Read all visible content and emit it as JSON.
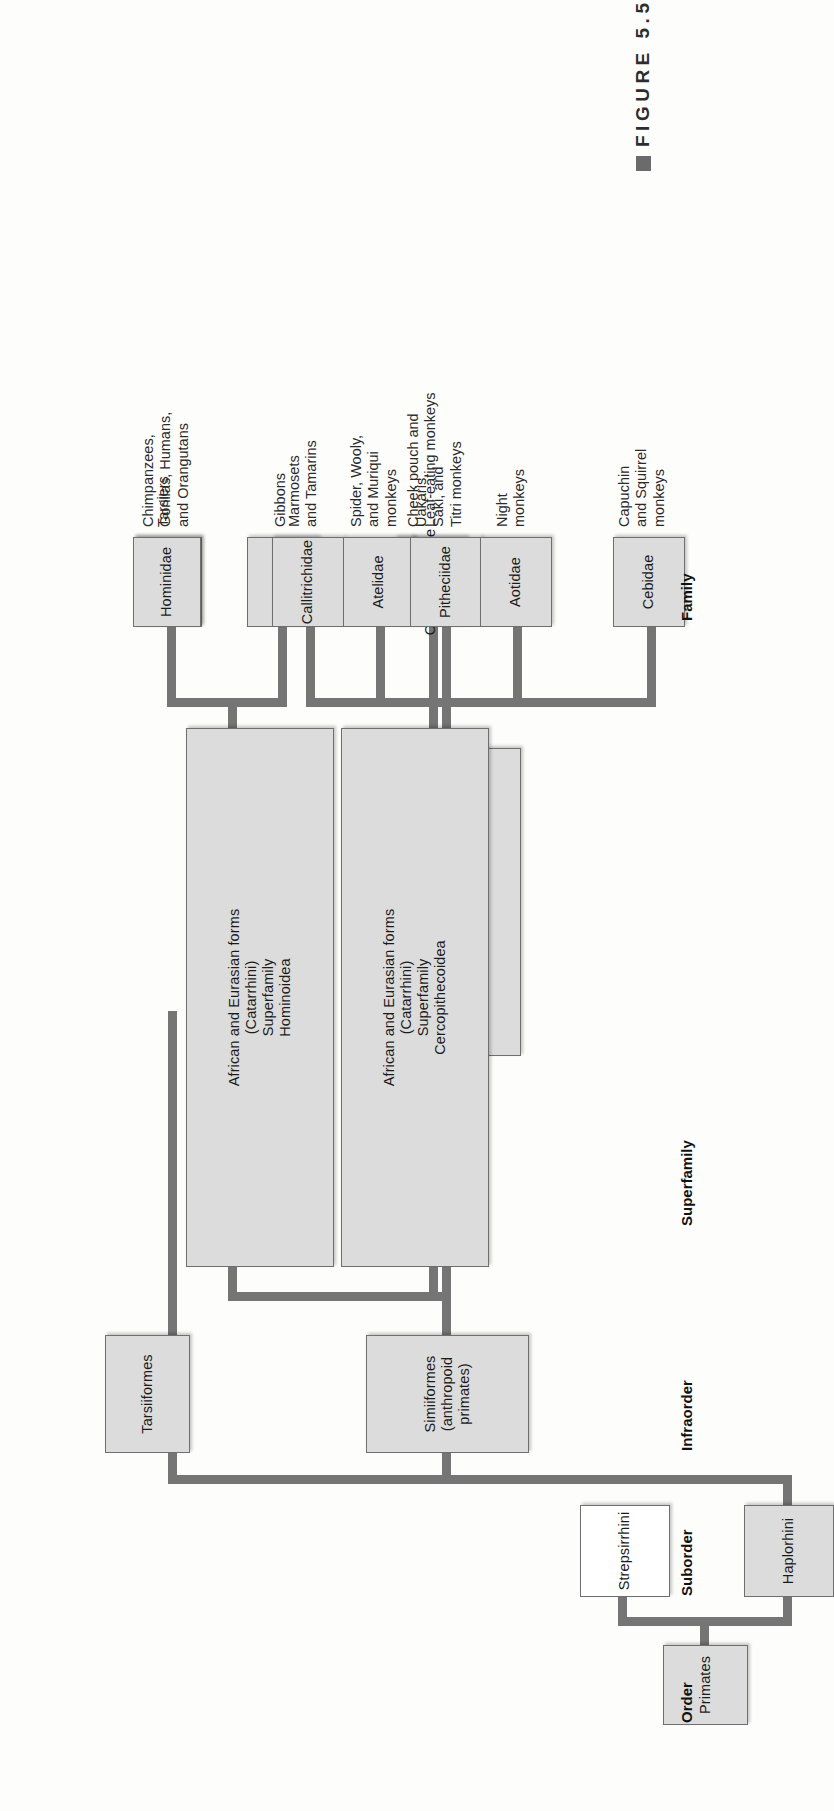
{
  "figure": {
    "caption_label": "FIGURE 5.5",
    "bullet_icon": "filled-square-bullet"
  },
  "rank_labels": [
    {
      "id": "order",
      "text": "Order"
    },
    {
      "id": "suborder",
      "text": "Suborder"
    },
    {
      "id": "infraorder",
      "text": "Infraorder"
    },
    {
      "id": "superfamily",
      "text": "Superfamily"
    },
    {
      "id": "family",
      "text": "Family"
    }
  ],
  "colors": {
    "box_fill": "#dcdcdc",
    "box_fill_hollow": "#ffffff",
    "box_border": "#6f6f6f",
    "connector": "#757575",
    "text": "#1b1b1b",
    "background": "#fdfdfc"
  },
  "nodes": {
    "primates": {
      "label": "Primates",
      "rank": "Order",
      "fill": "filled"
    },
    "strepsirrhini": {
      "label": "Strepsirrhini",
      "rank": "Suborder",
      "fill": "hollow"
    },
    "haplorhini": {
      "label": "Haplorhini",
      "rank": "Suborder",
      "fill": "filled"
    },
    "tarsiiformes": {
      "label": "Tarsiiformes",
      "rank": "Infraorder",
      "fill": "filled"
    },
    "simiiformes": {
      "label": "Simiiformes\n(anthropoid primates)",
      "rank": "Infraorder",
      "fill": "filled"
    },
    "ceboidea": {
      "label": "N. and S. American forms\n(Platyrrhini)\nSuperfamily\nCeboidea",
      "rank": "Superfamily",
      "fill": "filled"
    },
    "cercopithecoidea": {
      "label": "African and Eurasian forms\n(Catarrhini)\nSuperfamily\nCercopithecoidea",
      "rank": "Superfamily",
      "fill": "filled"
    },
    "hominoidea": {
      "label": "African and Eurasian forms\n(Catarrhini)\nSuperfamily\nHominoidea",
      "rank": "Superfamily",
      "fill": "filled"
    }
  },
  "families": [
    {
      "id": "tarsidae",
      "label": "Tarsidae",
      "common": "Tarsiers"
    },
    {
      "id": "hominidae",
      "label": "Hominidae",
      "common": "Chimpanzees,\nGorillas, Humans,\nand Orangutans"
    },
    {
      "id": "hylobatidae",
      "label": "Hylobatidae",
      "common": "Gibbons"
    },
    {
      "id": "cercopithecidae",
      "label": "Cercopithecidae",
      "common": "Cheek pouch and\nLeaf-eating monkeys"
    },
    {
      "id": "callitrichidae",
      "label": "Callitrichidae",
      "common": "Marmosets\nand Tamarins"
    },
    {
      "id": "atelidae",
      "label": "Atelidae",
      "common": "Spider, Wooly,\nand Muriqui\nmonkeys"
    },
    {
      "id": "pitheciidae",
      "label": "Pitheciidae",
      "common": "Uakaris,\nSaki, and\nTitri monkeys"
    },
    {
      "id": "aotidae",
      "label": "Aotidae",
      "common": "Night\nmonkeys"
    },
    {
      "id": "cebidae",
      "label": "Cebidae",
      "common": "Capuchin\nand Squirrel\nmonkeys"
    }
  ]
}
